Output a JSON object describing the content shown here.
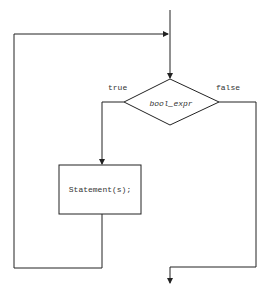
{
  "diagram": {
    "type": "flowchart",
    "condition": "bool_expr",
    "true_label": "true",
    "false_label": "false",
    "body": "Statement(s);",
    "colors": {
      "line": "#222222",
      "text": "#333333",
      "background": "#ffffff"
    }
  }
}
